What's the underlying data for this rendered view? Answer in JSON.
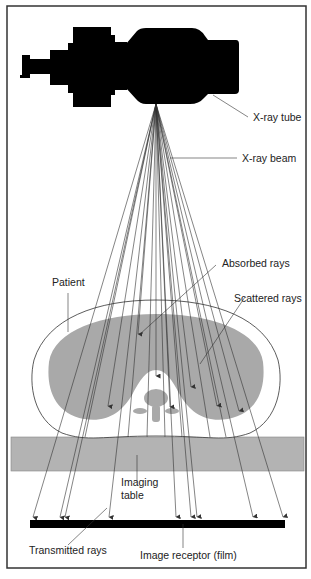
{
  "diagram": {
    "labels": {
      "tube": "X-ray tube",
      "beam": "X-ray beam",
      "absorbed": "Absorbed rays",
      "patient": "Patient",
      "scattered": "Scattered rays",
      "table_line1": "Imaging",
      "table_line2": "table",
      "transmitted": "Transmitted rays",
      "receptor": "Image receptor (film)"
    },
    "colors": {
      "frame": "#333333",
      "tube": "#000000",
      "body_tissue": "#a9a9a9",
      "table": "#b3b3b3",
      "film": "#000000",
      "ray": "#333333"
    }
  }
}
